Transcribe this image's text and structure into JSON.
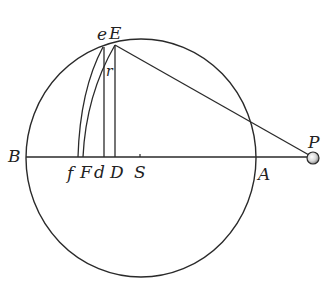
{
  "figure": {
    "type": "geometric diagram"
  },
  "colors": {
    "stroke": "#2a2a2a",
    "background": "#ffffff",
    "ball_fill": "#e8e8e8",
    "ball_shade": "#9a9a9a"
  },
  "circle": {
    "cx": 141,
    "cy": 158,
    "rx": 115,
    "ry": 119
  },
  "baseline": {
    "x1": 26,
    "y1": 157,
    "x2": 308,
    "y2": 157
  },
  "points": {
    "E": {
      "x": 115,
      "y": 45
    },
    "e": {
      "x": 103,
      "y": 47
    },
    "D": {
      "x": 115,
      "y": 157
    },
    "d": {
      "x": 104,
      "y": 157
    },
    "F": {
      "x": 83,
      "y": 157
    },
    "f": {
      "x": 78,
      "y": 157
    },
    "S": {
      "x": 140,
      "y": 157
    },
    "P": {
      "x": 313,
      "y": 158
    },
    "r": {
      "x": 107,
      "y": 70
    }
  },
  "labels": {
    "B": "B",
    "A": "A",
    "P": "P",
    "E": "E",
    "e": "e",
    "r": "r",
    "f": "f",
    "F": "F",
    "d": "d",
    "D": "D",
    "S": "S"
  }
}
